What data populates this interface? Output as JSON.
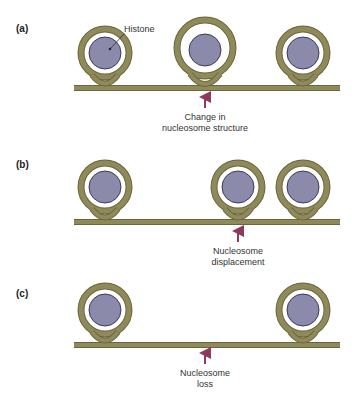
{
  "colors": {
    "dna": "#8f8a5a",
    "dna_edge": "#6b6640",
    "histone": "#8c8aab",
    "histone_edge": "#3d3a5c",
    "arrow": "#8e3a5e",
    "background": "#ffffff"
  },
  "panels": [
    {
      "label": "(a)",
      "callout": "Histone",
      "caption_line1": "Change in",
      "caption_line2": "nucleosome structure"
    },
    {
      "label": "(b)",
      "caption_line1": "Nucleosome",
      "caption_line2": "displacement"
    },
    {
      "label": "(c)",
      "caption_line1": "Nucleosome",
      "caption_line2": "loss"
    }
  ]
}
